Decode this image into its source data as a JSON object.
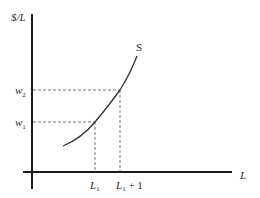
{
  "diagram": {
    "y_axis_label": "$/L",
    "x_axis_label": "L",
    "curve_label": "S",
    "y_ticks": [
      {
        "base": "w",
        "sub": "2",
        "y": 90
      },
      {
        "base": "w",
        "sub": "1",
        "y": 122
      }
    ],
    "x_ticks": [
      {
        "base": "L",
        "sub": "1",
        "suffix": "",
        "x": 95
      },
      {
        "base": "L",
        "sub": "1",
        "suffix": " + 1",
        "x": 120
      }
    ],
    "colors": {
      "axis": "#1a1a1a",
      "curve": "#333333",
      "guide": "#555555"
    }
  }
}
